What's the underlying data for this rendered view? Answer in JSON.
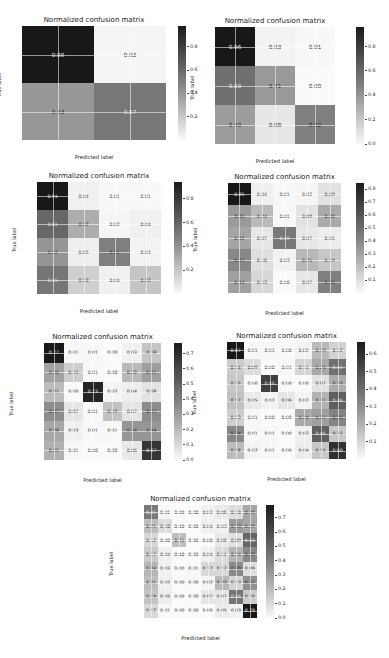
{
  "chart_data": [
    {
      "type": "heatmap",
      "title": "Normalized confusion matrix",
      "xlabel": "Predicted label",
      "ylabel": "True label",
      "labels": [
        "MEL",
        "VASC"
      ],
      "matrix": [
        [
          0.98,
          0.02
        ],
        [
          0.43,
          0.57
        ]
      ],
      "colorbar_ticks": [
        "0.2",
        "0.4",
        "0.6",
        "0.8"
      ]
    },
    {
      "type": "heatmap",
      "title": "Normalized confusion matrix",
      "xlabel": "Predicted label",
      "ylabel": "True label",
      "labels": [
        "0",
        "1",
        "2"
      ],
      "matrix": [
        [
          0.96,
          0.03,
          0.01
        ],
        [
          0.59,
          0.41,
          0.0
        ],
        [
          0.4,
          0.08,
          0.52
        ]
      ],
      "colorbar_ticks": [
        "0.0",
        "0.2",
        "0.4",
        "0.6",
        "0.8"
      ]
    },
    {
      "type": "heatmap",
      "title": "Normalized confusion matrix",
      "xlabel": "Predicted label",
      "ylabel": "True label",
      "labels": [
        "0",
        "1",
        "2",
        "3"
      ],
      "matrix": [
        [
          0.94,
          0.04,
          0.01,
          0.01
        ],
        [
          0.61,
          0.32,
          0.02,
          0.04
        ],
        [
          0.42,
          0.05,
          0.51,
          0.03
        ],
        [
          0.55,
          0.18,
          0.04,
          0.22
        ]
      ],
      "colorbar_ticks": [
        "0.2",
        "0.4",
        "0.6",
        "0.8"
      ]
    },
    {
      "type": "heatmap",
      "title": "Normalized confusion matrix",
      "xlabel": "Predicted label",
      "ylabel": "True label",
      "labels": [
        "MEL",
        "SCC",
        "VASC",
        "DF",
        "AK"
      ],
      "matrix": [
        [
          0.85,
          0.04,
          0.01,
          0.02,
          0.09
        ],
        [
          0.36,
          0.24,
          0.01,
          0.09,
          0.3
        ],
        [
          0.32,
          0.07,
          0.49,
          0.07,
          0.05
        ],
        [
          0.43,
          0.1,
          0.03,
          0.25,
          0.19
        ],
        [
          0.34,
          0.13,
          0.0,
          0.07,
          0.46
        ]
      ],
      "colorbar_ticks": [
        "0.1",
        "0.2",
        "0.3",
        "0.4",
        "0.5",
        "0.6",
        "0.7",
        "0.8"
      ]
    },
    {
      "type": "heatmap",
      "title": "Normalized confusion matrix",
      "xlabel": "Predicted label",
      "ylabel": "True label",
      "labels": [
        "MEL",
        "SCC",
        "VASC",
        "DF",
        "AK",
        "BKL"
      ],
      "matrix": [
        [
          0.77,
          0.01,
          0.01,
          0.0,
          0.03,
          0.18
        ],
        [
          0.3,
          0.15,
          0.01,
          0.0,
          0.22,
          0.31
        ],
        [
          0.21,
          0.0,
          0.73,
          0.02,
          0.04,
          0.08
        ],
        [
          0.37,
          0.07,
          0.01,
          0.19,
          0.07,
          0.37
        ],
        [
          0.28,
          0.03,
          0.01,
          0.01,
          0.34,
          0.34
        ],
        [
          0.25,
          0.01,
          0.0,
          0.0,
          0.06,
          0.67
        ]
      ],
      "colorbar_ticks": [
        "0.0",
        "0.1",
        "0.2",
        "0.3",
        "0.4",
        "0.5",
        "0.6",
        "0.7"
      ]
    },
    {
      "type": "heatmap",
      "title": "Normalized confusion matrix",
      "xlabel": "Predicted label",
      "ylabel": "True label",
      "labels": [
        "MEL",
        "SCC",
        "VASC",
        "DF",
        "AK",
        "BKL",
        "BCC"
      ],
      "matrix": [
        [
          0.67,
          0.01,
          0.01,
          0.0,
          0.02,
          0.19,
          0.12
        ],
        [
          0.14,
          0.09,
          0.0,
          0.01,
          0.11,
          0.24,
          0.41
        ],
        [
          0.15,
          0.0,
          0.55,
          0.0,
          0.0,
          0.07,
          0.23
        ],
        [
          0.17,
          0.05,
          0.02,
          0.06,
          0.02,
          0.21,
          0.46
        ],
        [
          0.13,
          0.01,
          0.0,
          0.0,
          0.24,
          0.27,
          0.35
        ],
        [
          0.34,
          0.01,
          0.01,
          0.0,
          0.03,
          0.46,
          0.15
        ],
        [
          0.18,
          0.02,
          0.01,
          0.0,
          0.04,
          0.15,
          0.6
        ]
      ],
      "colorbar_ticks": [
        "0.1",
        "0.2",
        "0.3",
        "0.4",
        "0.5",
        "0.6"
      ]
    },
    {
      "type": "heatmap",
      "title": "Normalized confusion matrix",
      "xlabel": "Predicted label",
      "ylabel": "True label",
      "labels": [
        "MEL",
        "SCC",
        "VASC",
        "DF",
        "AK",
        "BKL",
        "BCC",
        "NV"
      ],
      "matrix": [
        [
          0.45,
          0.01,
          0.0,
          0.0,
          0.03,
          0.06,
          0.1,
          0.29
        ],
        [
          0.21,
          0.1,
          0.0,
          0.0,
          0.04,
          0.03,
          0.33,
          0.29
        ],
        [
          0.12,
          0.0,
          0.21,
          0.0,
          0.0,
          0.06,
          0.09,
          0.52
        ],
        [
          0.17,
          0.04,
          0.0,
          0.0,
          0.04,
          0.11,
          0.24,
          0.39
        ],
        [
          0.24,
          0.03,
          0.0,
          0.01,
          0.12,
          0.12,
          0.39,
          0.09
        ],
        [
          0.21,
          0.03,
          0.0,
          0.0,
          0.02,
          0.23,
          0.13,
          0.37
        ],
        [
          0.19,
          0.05,
          0.0,
          0.0,
          0.07,
          0.07,
          0.46,
          0.16
        ],
        [
          0.12,
          0.01,
          0.0,
          0.0,
          0.0,
          0.05,
          0.03,
          0.79
        ]
      ],
      "colorbar_ticks": [
        "0.0",
        "0.1",
        "0.2",
        "0.3",
        "0.4",
        "0.5",
        "0.6",
        "0.7"
      ]
    }
  ],
  "layout": [
    {
      "x": 22,
      "y": 26,
      "w": 144,
      "h": 114,
      "cbx": 178,
      "cby": 26,
      "cbh": 114,
      "vmax": 0.98
    },
    {
      "x": 215,
      "y": 27,
      "w": 120,
      "h": 117,
      "cbx": 356,
      "cby": 27,
      "cbh": 117,
      "vmax": 0.96
    },
    {
      "x": 37,
      "y": 182,
      "w": 124,
      "h": 112,
      "cbx": 174,
      "cby": 182,
      "cbh": 112,
      "vmax": 0.94
    },
    {
      "x": 228,
      "y": 183,
      "w": 113,
      "h": 110,
      "cbx": 356,
      "cby": 183,
      "cbh": 110,
      "vmax": 0.85
    },
    {
      "x": 44,
      "y": 343,
      "w": 117,
      "h": 117,
      "cbx": 174,
      "cby": 343,
      "cbh": 117,
      "vmax": 0.77
    },
    {
      "x": 227,
      "y": 342,
      "w": 119,
      "h": 117,
      "cbx": 357,
      "cby": 342,
      "cbh": 117,
      "vmax": 0.67
    },
    {
      "x": 144,
      "y": 505,
      "w": 113,
      "h": 113,
      "cbx": 266,
      "cby": 505,
      "cbh": 113,
      "vmax": 0.79
    }
  ]
}
